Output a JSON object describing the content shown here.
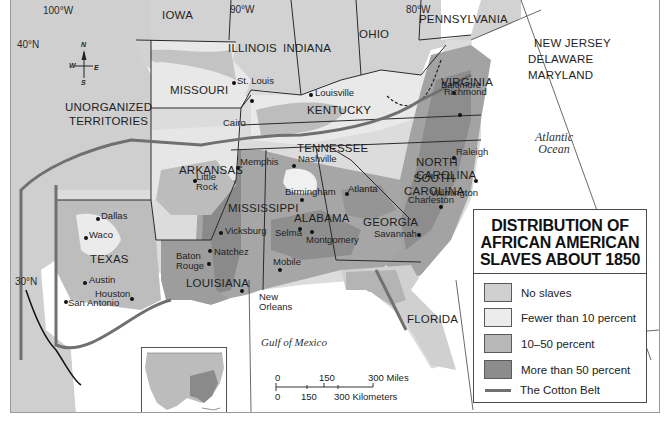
{
  "title": {
    "lines": [
      "Distribution of",
      "African American",
      "Slaves About 1850"
    ]
  },
  "legend": {
    "items": [
      {
        "label": "No slaves",
        "color": "#cfcfcf"
      },
      {
        "label": "Fewer than 10 percent",
        "color": "#ececec"
      },
      {
        "label": "10–50 percent",
        "color": "#b7b7b7"
      },
      {
        "label": "More than 50 percent",
        "color": "#8c8c8c"
      },
      {
        "label": "The Cotton Belt",
        "color": "#6e6e6e",
        "type": "line"
      }
    ]
  },
  "grid_labels": {
    "lon_100": "100°W",
    "lon_90": "90°W",
    "lon_80": "80°W",
    "lat_40": "40°N",
    "lat_30": "30°N"
  },
  "compass": {
    "n": "N",
    "s": "S",
    "e": "E",
    "w": "W"
  },
  "states": {
    "iowa": "Iowa",
    "illinois": "Illinois",
    "indiana": "Indiana",
    "ohio": "Ohio",
    "pennsylvania": "Pennsylvania",
    "new_jersey": "New Jersey",
    "delaware": "Delaware",
    "maryland": "Maryland",
    "missouri": "Missouri",
    "kentucky": "Kentucky",
    "virginia": "Virginia",
    "unorganized": [
      "Unorganized",
      "Territories"
    ],
    "tennessee": "Tennessee",
    "north_carolina": [
      "North",
      "Carolina"
    ],
    "arkansas": "Arkansas",
    "south_carolina": [
      "South",
      "Carolina"
    ],
    "mississippi": "Mississippi",
    "alabama": "Alabama",
    "georgia": "Georgia",
    "texas": "Texas",
    "louisiana": "Louisiana",
    "florida": "Florida"
  },
  "cities": {
    "st_louis": "St. Louis",
    "louisville": "Louisville",
    "baltimore": "Baltimore",
    "richmond": "Richmond",
    "cairo": "Cairo",
    "nashville": "Nashville",
    "raleigh": "Raleigh",
    "memphis": "Memphis",
    "little_rock": [
      "Little",
      "Rock"
    ],
    "wilmington": "Wilmington",
    "birmingham": "Birmingham",
    "atlanta": "Atlanta",
    "charleston": "Charleston",
    "dallas": "Dallas",
    "waco": "Waco",
    "vicksburg": "Vicksburg",
    "selma": "Selma",
    "montgomery": "Montgomery",
    "savannah": "Savannah",
    "baton_rouge": [
      "Baton",
      "Rouge"
    ],
    "natchez": "Natchez",
    "mobile": "Mobile",
    "austin": "Austin",
    "houston": "Houston",
    "san_antonio": "San Antonio",
    "new_orleans": [
      "New",
      "Orleans"
    ]
  },
  "water": {
    "atlantic": [
      "Atlantic",
      "Ocean"
    ],
    "gulf": "Gulf of Mexico"
  },
  "scale": {
    "miles": [
      "0",
      "150",
      "300 Miles"
    ],
    "km": [
      "0",
      "150",
      "300 Kilometers"
    ]
  }
}
